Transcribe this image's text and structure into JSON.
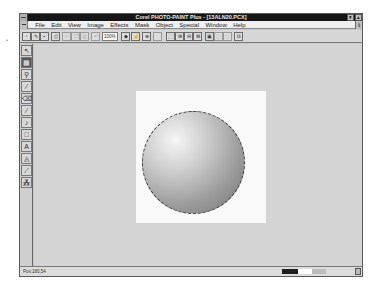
{
  "window": {
    "title": "Corel PHOTO-PAINT Plus - [13ALN20.PCX]",
    "controls": {
      "minimize": "▾",
      "maximize": "▴",
      "doc_restore": "⇕"
    }
  },
  "menubar": {
    "items": [
      "File",
      "Edit",
      "View",
      "Image",
      "Effects",
      "Mask",
      "Object",
      "Special",
      "Window",
      "Help"
    ]
  },
  "toolbar": {
    "buttons": [
      {
        "name": "new-file",
        "glyph": "▫"
      },
      {
        "name": "open-file",
        "glyph": "✎"
      },
      {
        "name": "save-file",
        "glyph": "▪"
      },
      {
        "name": "print",
        "glyph": "⎙"
      },
      {
        "name": "cut",
        "glyph": "✂"
      },
      {
        "name": "copy",
        "glyph": "❐"
      },
      {
        "name": "paste",
        "glyph": "▤"
      },
      {
        "name": "undo",
        "glyph": "↶"
      }
    ],
    "zoom_value": "100%",
    "right_buttons": [
      {
        "name": "zoom-spin",
        "glyph": "◆"
      },
      {
        "name": "hand",
        "glyph": "☝"
      },
      {
        "name": "zoom-tool",
        "glyph": "⊕"
      },
      {
        "name": "blank",
        "glyph": ""
      },
      {
        "name": "mask-rect",
        "glyph": "⬚"
      },
      {
        "name": "mask-add",
        "glyph": "⊞"
      },
      {
        "name": "mask-sub",
        "glyph": "⊟"
      },
      {
        "name": "mask-xor",
        "glyph": "⊠"
      },
      {
        "name": "object-mode",
        "glyph": "▣"
      },
      {
        "name": "object-add",
        "glyph": "▢"
      },
      {
        "name": "object-sub",
        "glyph": "▢"
      },
      {
        "name": "layers",
        "glyph": "⧉"
      }
    ]
  },
  "toolbox": {
    "tools": [
      {
        "name": "pointer",
        "glyph": "↖",
        "active": false
      },
      {
        "name": "mask",
        "glyph": "▦",
        "active": true
      },
      {
        "name": "zoom",
        "glyph": "⚲",
        "active": false
      },
      {
        "name": "eyedropper",
        "glyph": "⁄",
        "active": false
      },
      {
        "name": "eraser",
        "glyph": "⌫",
        "active": false
      },
      {
        "name": "line",
        "glyph": "∕",
        "active": false
      },
      {
        "name": "paint",
        "glyph": "♪",
        "active": false
      },
      {
        "name": "rectangle",
        "glyph": "□",
        "active": false
      },
      {
        "name": "text",
        "glyph": "A",
        "active": false
      },
      {
        "name": "fill",
        "glyph": "◬",
        "active": false
      },
      {
        "name": "brush",
        "glyph": "⟋",
        "active": false
      },
      {
        "name": "clone",
        "glyph": "⁂",
        "active": false
      }
    ]
  },
  "statusbar": {
    "position": "Pos:180,54",
    "swatches": {
      "outline": "#1e1e1e",
      "fill": "#ffffff",
      "texture": "#bdbdbd"
    },
    "scroll_glyph": "⇕"
  },
  "canvas": {
    "background": "#d4d4d4",
    "image_background": "#f9f9f9",
    "object": "gray shaded sphere with dashed mask marquee"
  },
  "stray_mark": "•"
}
